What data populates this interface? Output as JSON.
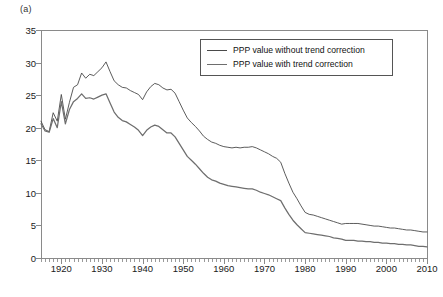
{
  "figure": {
    "panel_label": "(a)"
  },
  "legend": {
    "position": "top-right-inside",
    "entries": [
      {
        "label": "PPP value without trend correction",
        "swatch": "thin-line"
      },
      {
        "label": "PPP value with trend correction",
        "swatch": "thick-line"
      }
    ]
  },
  "chart_data": {
    "type": "line",
    "title": "",
    "xlabel": "",
    "ylabel": "",
    "xlim": [
      1915,
      2010
    ],
    "ylim": [
      0,
      35
    ],
    "ytick_values": [
      0,
      5,
      10,
      15,
      20,
      25,
      30,
      35
    ],
    "ytick_labels": [
      "0",
      "5",
      "10",
      "15",
      "20",
      "25",
      "30",
      "35"
    ],
    "xtick_values": [
      1920,
      1930,
      1940,
      1950,
      1960,
      1970,
      1980,
      1990,
      2000,
      2010
    ],
    "xtick_labels": [
      "1920",
      "1930",
      "1940",
      "1950",
      "1960",
      "1970",
      "1980",
      "1990",
      "2000",
      "2010"
    ],
    "minor_xticks": "annual",
    "grid": false,
    "x": [
      1915,
      1916,
      1917,
      1918,
      1919,
      1920,
      1921,
      1922,
      1923,
      1924,
      1925,
      1926,
      1927,
      1928,
      1929,
      1930,
      1931,
      1932,
      1933,
      1934,
      1935,
      1936,
      1937,
      1938,
      1939,
      1940,
      1941,
      1942,
      1943,
      1944,
      1945,
      1946,
      1947,
      1948,
      1949,
      1950,
      1951,
      1952,
      1953,
      1954,
      1955,
      1956,
      1957,
      1958,
      1959,
      1960,
      1961,
      1962,
      1963,
      1964,
      1965,
      1966,
      1967,
      1968,
      1969,
      1970,
      1971,
      1972,
      1973,
      1974,
      1975,
      1976,
      1977,
      1978,
      1979,
      1980,
      1981,
      1982,
      1983,
      1984,
      1985,
      1986,
      1987,
      1988,
      1989,
      1990,
      1991,
      1992,
      1993,
      1994,
      1995,
      1996,
      1997,
      1998,
      1999,
      2000,
      2001,
      2002,
      2003,
      2004,
      2005,
      2006,
      2007,
      2008,
      2009,
      2010
    ],
    "series": [
      {
        "name": "PPP value without trend correction",
        "style": "thin-line",
        "values": [
          21.0,
          19.7,
          19.4,
          22.3,
          21.0,
          25.1,
          21.3,
          23.9,
          26.2,
          26.6,
          28.4,
          27.6,
          28.2,
          28.0,
          28.6,
          29.2,
          30.1,
          28.6,
          27.2,
          26.6,
          26.2,
          26.1,
          25.7,
          25.4,
          25.1,
          24.3,
          25.5,
          26.3,
          26.8,
          26.6,
          26.1,
          25.8,
          25.9,
          25.3,
          24.0,
          22.7,
          21.5,
          20.8,
          20.2,
          19.5,
          18.7,
          18.2,
          17.8,
          17.6,
          17.3,
          17.1,
          17.0,
          16.9,
          17.0,
          16.9,
          17.0,
          17.0,
          17.1,
          16.9,
          16.6,
          16.3,
          16.0,
          15.6,
          15.3,
          14.7,
          13.0,
          11.5,
          10.1,
          9.1,
          8.0,
          7.0,
          6.7,
          6.6,
          6.4,
          6.2,
          6.0,
          5.8,
          5.6,
          5.4,
          5.2,
          5.3,
          5.3,
          5.3,
          5.3,
          5.2,
          5.1,
          5.0,
          4.9,
          4.9,
          4.8,
          4.7,
          4.6,
          4.6,
          4.5,
          4.4,
          4.3,
          4.3,
          4.2,
          4.1,
          4.0,
          4.0
        ]
      },
      {
        "name": "PPP value with trend correction",
        "style": "thick-line",
        "values": [
          20.6,
          19.5,
          19.3,
          21.4,
          20.0,
          24.0,
          20.6,
          22.8,
          24.0,
          24.5,
          25.2,
          24.5,
          24.6,
          24.4,
          24.7,
          25.0,
          25.2,
          23.8,
          22.4,
          21.6,
          21.1,
          20.9,
          20.5,
          20.1,
          19.6,
          18.8,
          19.6,
          20.1,
          20.4,
          20.2,
          19.7,
          19.2,
          19.2,
          18.6,
          17.6,
          16.6,
          15.6,
          15.0,
          14.4,
          13.7,
          13.0,
          12.4,
          12.0,
          11.8,
          11.5,
          11.3,
          11.1,
          11.0,
          10.9,
          10.8,
          10.7,
          10.6,
          10.6,
          10.4,
          10.1,
          9.9,
          9.7,
          9.4,
          9.1,
          8.8,
          7.7,
          6.7,
          5.8,
          5.1,
          4.5,
          3.9,
          3.8,
          3.7,
          3.6,
          3.5,
          3.4,
          3.3,
          3.1,
          3.0,
          2.9,
          2.7,
          2.7,
          2.7,
          2.6,
          2.6,
          2.5,
          2.5,
          2.4,
          2.4,
          2.3,
          2.3,
          2.2,
          2.2,
          2.1,
          2.1,
          2.0,
          2.0,
          1.9,
          1.8,
          1.8,
          1.7
        ]
      }
    ]
  },
  "colors": {
    "axis": "#8a8a8a",
    "series_without": "#4a4a4a",
    "series_with": "#6e6e6e",
    "background": "#ffffff",
    "text": "#1a1a1a"
  }
}
